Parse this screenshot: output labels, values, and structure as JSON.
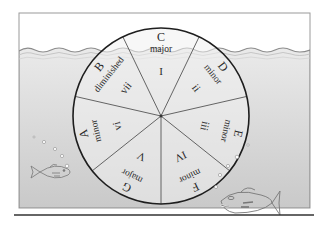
{
  "diagram": {
    "center": {
      "x": 161,
      "y": 116
    },
    "radius": 88,
    "colors": {
      "background": "#ffffff",
      "panel_border": "#9a9a9a",
      "water_fill": "#e2e2e2",
      "water_fill_deep": "#cfcfcf",
      "wheel_stroke": "#1e1e1e",
      "divider_stroke": "#555555",
      "text": "#2a2a2a",
      "base_line": "#333333"
    },
    "segments": [
      {
        "note": "C",
        "quality": "major",
        "numeral": "I",
        "angle": 0
      },
      {
        "note": "D",
        "quality": "minor",
        "numeral": "ii",
        "angle": 51.43
      },
      {
        "note": "E",
        "quality": "minor",
        "numeral": "iii",
        "angle": 102.86
      },
      {
        "note": "F",
        "quality": "minor",
        "numeral": "IV",
        "angle": 154.29
      },
      {
        "note": "G",
        "quality": "major",
        "numeral": "V",
        "angle": 205.71
      },
      {
        "note": "A",
        "quality": "minor",
        "numeral": "vi",
        "angle": 257.14
      },
      {
        "note": "B",
        "quality": "diminished",
        "numeral": "vii",
        "angle": 308.57
      }
    ],
    "decorations": {
      "water_line_y": 51,
      "fish": [
        {
          "label": "small-fish-left",
          "x": 30,
          "y": 173,
          "scale": 0.55,
          "facing": "right"
        },
        {
          "label": "large-fish-right",
          "x": 218,
          "y": 197,
          "scale": 1.0,
          "facing": "left"
        }
      ]
    }
  }
}
